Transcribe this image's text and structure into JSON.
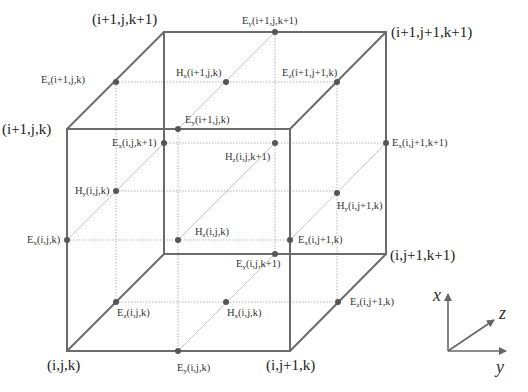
{
  "diagram": {
    "colors": {
      "edge": "#6b6b6b",
      "grid": "#b0b0b0",
      "diag": "#c4c4c4",
      "dot": "#555555",
      "text": "#333333"
    },
    "corners": [
      {
        "id": "c000",
        "label": "(i,j,k)"
      },
      {
        "id": "c010",
        "label": "(i,j+1,k)"
      },
      {
        "id": "c100",
        "label": "(i+1,j,k)"
      },
      {
        "id": "c001",
        "label": "(i,j,k+1)"
      },
      {
        "id": "c101",
        "label": "(i+1,j,k+1)"
      },
      {
        "id": "c111",
        "label": "(i+1,j+1,k+1)"
      },
      {
        "id": "c011",
        "label": "(i,j+1,k+1)"
      }
    ],
    "nodes": [
      {
        "id": "ey_i1_j_k1",
        "sym": "E",
        "sub": "y",
        "args": "(i+1,j,k+1)"
      },
      {
        "id": "ez_i1_j_k",
        "sym": "E",
        "sub": "z",
        "args": "(i+1,j,k)"
      },
      {
        "id": "hx_i1_j_k",
        "sym": "H",
        "sub": "x",
        "args": "(i+1,j,k)"
      },
      {
        "id": "ez_i1_j1_k",
        "sym": "E",
        "sub": "z",
        "args": "(i+1,j+1,k)"
      },
      {
        "id": "ey_i1_j_k",
        "sym": "E",
        "sub": "y",
        "args": "(i+1,j,k)"
      },
      {
        "id": "ex_i_j_k1",
        "sym": "E",
        "sub": "x",
        "args": "(i,j,k+1)"
      },
      {
        "id": "hz_i_j_k1",
        "sym": "H",
        "sub": "z",
        "args": "(i,j,k+1)"
      },
      {
        "id": "ex_i_j1_k1",
        "sym": "E",
        "sub": "x",
        "args": "(i,j+1,k+1)"
      },
      {
        "id": "hy_i_j_k",
        "sym": "H",
        "sub": "y",
        "args": "(i,j,k)"
      },
      {
        "id": "hy_i_j1_k",
        "sym": "H",
        "sub": "y",
        "args": "(i,j+1,k)"
      },
      {
        "id": "ex_i_j_k",
        "sym": "E",
        "sub": "x",
        "args": "(i,j,k)"
      },
      {
        "id": "hz_i_j_k",
        "sym": "H",
        "sub": "z",
        "args": "(i,j,k)"
      },
      {
        "id": "ex_i_j1_k",
        "sym": "E",
        "sub": "x",
        "args": "(i,j+1,k)"
      },
      {
        "id": "ey_i_j_k1",
        "sym": "E",
        "sub": "y",
        "args": "(i,j,k+1)"
      },
      {
        "id": "ez_i_j_k",
        "sym": "E",
        "sub": "z",
        "args": "(i,j,k)"
      },
      {
        "id": "hx_i_j_k",
        "sym": "H",
        "sub": "x",
        "args": "(i,j,k)"
      },
      {
        "id": "ez_i_j1_k",
        "sym": "E",
        "sub": "z",
        "args": "(i,j+1,k)"
      },
      {
        "id": "ey_i_j_k",
        "sym": "E",
        "sub": "y",
        "args": "(i,j,k)"
      }
    ],
    "axes": {
      "x": "x",
      "y": "y",
      "z": "z"
    }
  }
}
